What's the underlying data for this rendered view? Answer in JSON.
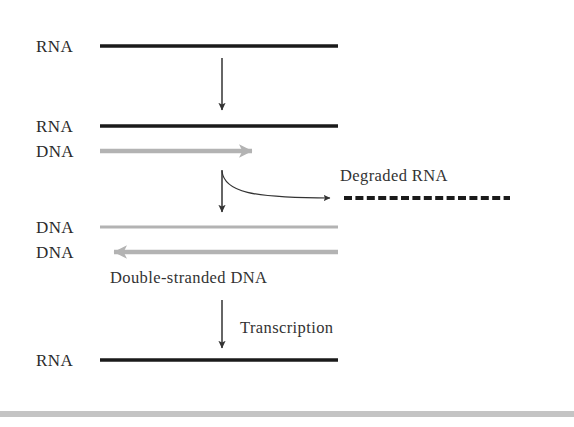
{
  "figure": {
    "type": "biology-process-diagram",
    "background_color": "#ffffff",
    "colors": {
      "rna_strand": "#1a1a1a",
      "dna_strand": "#b3b3b3",
      "arrow": "#333333",
      "text": "#2b2b2b",
      "bottom_rule": "#c4c4c4"
    },
    "strand_labels": [
      {
        "id": "rna-top",
        "text": "RNA",
        "x": 36,
        "y": 38
      },
      {
        "id": "rna-second",
        "text": "RNA",
        "x": 36,
        "y": 118
      },
      {
        "id": "dna-third",
        "text": "DNA",
        "x": 36,
        "y": 143
      },
      {
        "id": "dna-fourth",
        "text": "DNA",
        "x": 36,
        "y": 219
      },
      {
        "id": "dna-fifth",
        "text": "DNA",
        "x": 36,
        "y": 244
      },
      {
        "id": "rna-bottom",
        "text": "RNA",
        "x": 36,
        "y": 352
      }
    ],
    "annotations": [
      {
        "id": "degraded-rna",
        "text": "Degraded RNA",
        "x": 340,
        "y": 168
      },
      {
        "id": "double-stranded-dna",
        "text": "Double-stranded DNA",
        "x": 110,
        "y": 270
      },
      {
        "id": "transcription",
        "text": "Transcription",
        "x": 240,
        "y": 320
      }
    ],
    "strands": [
      {
        "id": "rna-top-line",
        "kind": "rna-solid",
        "x1": 100,
        "x2": 338,
        "y": 46
      },
      {
        "id": "rna-second-line",
        "kind": "rna-solid",
        "x1": 100,
        "x2": 338,
        "y": 126
      },
      {
        "id": "dna-third-line",
        "kind": "dna-arrow-right",
        "x1": 100,
        "x2": 264,
        "y": 151
      },
      {
        "id": "dna-fourth-line",
        "kind": "dna-plain",
        "x1": 100,
        "x2": 338,
        "y": 227
      },
      {
        "id": "dna-fifth-line",
        "kind": "dna-arrow-left",
        "x1": 338,
        "x2": 100,
        "y": 252
      },
      {
        "id": "degraded-rna-line",
        "kind": "rna-dashed",
        "x1": 344,
        "x2": 510,
        "y": 198
      },
      {
        "id": "rna-bottom-line",
        "kind": "rna-solid",
        "x1": 100,
        "x2": 338,
        "y": 360
      }
    ],
    "arrows": [
      {
        "id": "arrow-reverse-transcription",
        "x": 222,
        "y1": 58,
        "y2": 112
      },
      {
        "id": "arrow-degradation",
        "x": 222,
        "y1": 170,
        "y2": 214
      },
      {
        "id": "arrow-transcription",
        "x": 222,
        "y1": 300,
        "y2": 350
      }
    ],
    "curved_arrow": {
      "id": "curve-to-degraded-rna",
      "start_x": 222,
      "start_y": 171,
      "end_x": 338,
      "end_y": 198
    },
    "bottom_rule": {
      "y": 411,
      "height": 6
    }
  }
}
